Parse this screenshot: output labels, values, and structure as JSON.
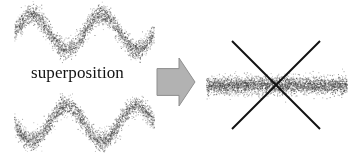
{
  "figure": {
    "caption": "superposition",
    "background_color": "#ffffff",
    "width": 358,
    "height": 160
  },
  "arrow": {
    "name": "block-arrow-right",
    "fill_color": "#b2b2b2",
    "edge_color": "#8e8e8e",
    "direction": "right",
    "x": 157,
    "y": 58,
    "width": 38,
    "height": 48
  },
  "cross": {
    "name": "x-cross-overlay",
    "color": "#111111",
    "line_width": 2,
    "left": 232,
    "right": 320,
    "top": 41,
    "bottom": 129
  },
  "chart_data": [
    {
      "type": "scatter",
      "name": "top-sine-scatter",
      "title": "",
      "xlabel": "",
      "ylabel": "",
      "grid": false,
      "legend": null,
      "point_color": "#4a4a4a",
      "axis_box": {
        "x": 14,
        "y": 4,
        "width": 140,
        "height": 56
      },
      "xlim": [
        0,
        1
      ],
      "ylim": [
        -1.6,
        1.6
      ],
      "noise_sigma": 0.28,
      "n_points": 2600,
      "curve": {
        "form": "sin",
        "amplitude": 1.0,
        "cycles": 2.0,
        "phase_deg": 0,
        "offset": 0
      }
    },
    {
      "type": "scatter",
      "name": "bottom-sine-scatter",
      "title": "",
      "xlabel": "",
      "ylabel": "",
      "grid": false,
      "legend": null,
      "point_color": "#4a4a4a",
      "axis_box": {
        "x": 14,
        "y": 95,
        "width": 140,
        "height": 56
      },
      "xlim": [
        0,
        1
      ],
      "ylim": [
        -1.6,
        1.6
      ],
      "noise_sigma": 0.28,
      "n_points": 2600,
      "curve": {
        "form": "sin",
        "amplitude": 1.0,
        "cycles": 2.0,
        "phase_deg": 180,
        "offset": 0
      }
    },
    {
      "type": "scatter",
      "name": "result-flat-band-scatter",
      "title": "",
      "xlabel": "",
      "ylabel": "",
      "grid": false,
      "legend": null,
      "point_color": "#4a4a4a",
      "axis_box": {
        "x": 206,
        "y": 62,
        "width": 141,
        "height": 46
      },
      "xlim": [
        0,
        1
      ],
      "ylim": [
        -1.6,
        1.6
      ],
      "noise_sigma": 0.3,
      "n_points": 3400,
      "curve": {
        "form": "constant",
        "amplitude": 0.0,
        "cycles": 0,
        "phase_deg": 0,
        "offset": 0
      }
    }
  ]
}
